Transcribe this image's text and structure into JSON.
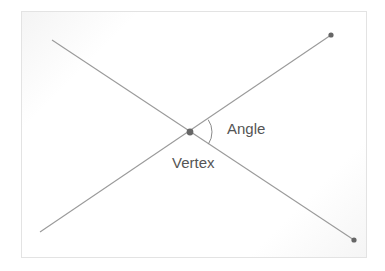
{
  "diagram": {
    "labels": {
      "angle": "Angle",
      "vertex": "Vertex"
    },
    "colors": {
      "line": "#9a9a9a",
      "dot": "#666666",
      "text": "#555555",
      "frame_border": "#e3e3e3"
    },
    "vertex": {
      "x": 190,
      "y": 132
    },
    "rays": [
      {
        "name": "ray-upper-right",
        "from": [
          190,
          132
        ],
        "to": [
          331,
          35
        ],
        "endpoint_dot": true
      },
      {
        "name": "ray-lower-left",
        "from": [
          190,
          132
        ],
        "to": [
          40,
          232
        ],
        "endpoint_dot": false
      },
      {
        "name": "ray-upper-left",
        "from": [
          190,
          132
        ],
        "to": [
          52,
          40
        ],
        "endpoint_dot": false
      },
      {
        "name": "ray-lower-right",
        "from": [
          190,
          132
        ],
        "to": [
          354,
          240
        ],
        "endpoint_dot": true
      }
    ],
    "angle_arc": {
      "center": [
        190,
        132
      ],
      "radius": 22
    }
  }
}
